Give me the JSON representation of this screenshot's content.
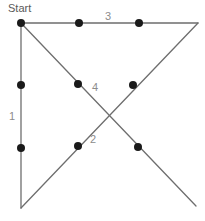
{
  "figure": {
    "title": "Start",
    "width": 205,
    "height": 221,
    "background_color": "#ffffff",
    "line_color": "#6e6e6e",
    "node_color": "#1a1a1a",
    "label_color": "#8c8c8c",
    "labels": [
      {
        "id": "start",
        "text": "Start",
        "x": 8,
        "y": 3
      },
      {
        "id": "segment-3",
        "text": "3",
        "x": 105,
        "y": 11
      },
      {
        "id": "segment-1",
        "text": "1",
        "x": 9,
        "y": 111
      },
      {
        "id": "segment-4",
        "text": "4",
        "x": 92,
        "y": 82
      },
      {
        "id": "segment-2",
        "text": "2",
        "x": 90,
        "y": 134
      }
    ],
    "vertices": [
      {
        "id": "top-left",
        "x": 21,
        "y": 23
      },
      {
        "id": "top-right",
        "x": 198,
        "y": 23
      },
      {
        "id": "bottom-left",
        "x": 21,
        "y": 208
      },
      {
        "id": "bottom-right",
        "x": 196,
        "y": 206
      },
      {
        "id": "center-crossing",
        "x": 109,
        "y": 116
      }
    ],
    "edges": [
      {
        "id": "edge-top",
        "label": "3",
        "x1": 21,
        "y1": 23,
        "x2": 198,
        "y2": 23
      },
      {
        "id": "edge-left",
        "label": "1",
        "x1": 21,
        "y1": 23,
        "x2": 21,
        "y2": 208
      },
      {
        "id": "edge-diagonal-down-right",
        "label": "2",
        "x1": 21,
        "y1": 23,
        "x2": 196,
        "y2": 206
      },
      {
        "id": "edge-diagonal-down-left",
        "label": "4",
        "x1": 198,
        "y1": 23,
        "x2": 21,
        "y2": 208
      }
    ],
    "nodes": [
      {
        "id": "node-start",
        "x": 21,
        "y": 23,
        "r": 4
      },
      {
        "id": "node-top-1",
        "x": 79,
        "y": 23,
        "r": 4
      },
      {
        "id": "node-top-2",
        "x": 139,
        "y": 23,
        "r": 4
      },
      {
        "id": "node-left-1",
        "x": 21,
        "y": 85,
        "r": 4
      },
      {
        "id": "node-left-2",
        "x": 21,
        "y": 148,
        "r": 4
      },
      {
        "id": "node-upper-left-diag",
        "x": 78,
        "y": 84,
        "r": 4
      },
      {
        "id": "node-upper-right-diag",
        "x": 133,
        "y": 85,
        "r": 4
      },
      {
        "id": "node-lower-left-diag",
        "x": 78,
        "y": 146,
        "r": 4
      },
      {
        "id": "node-lower-right-diag",
        "x": 138,
        "y": 147,
        "r": 4
      }
    ]
  }
}
